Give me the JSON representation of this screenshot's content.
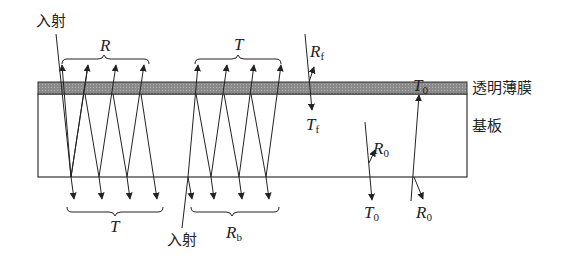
{
  "diagram": {
    "title": "",
    "layers": {
      "film_label": "透明薄膜",
      "substrate_label": "基板"
    },
    "incident_labels": {
      "top": "入射",
      "bottom": "入射"
    },
    "brace_labels": {
      "top_left": {
        "main": "R",
        "sub": ""
      },
      "top_right": {
        "main": "T",
        "sub": ""
      },
      "bottom_left": {
        "main": "T",
        "sub": ""
      },
      "bottom_right": {
        "main": "R",
        "sub": "b"
      }
    },
    "single_interface_labels": {
      "film_reflect": {
        "main": "R",
        "sub": "f"
      },
      "film_transmit": {
        "main": "T",
        "sub": "f"
      },
      "sub_top_reflect": {
        "main": "R",
        "sub": "0"
      },
      "sub_top_transmit": {
        "main": "T",
        "sub": "0"
      },
      "sub_bottom_transmit_up": {
        "main": "T",
        "sub": "0"
      },
      "sub_bottom_reflect": {
        "main": "R",
        "sub": "0"
      }
    },
    "colors": {
      "film_fill": "#8c8c8c",
      "line": "#222222"
    }
  }
}
